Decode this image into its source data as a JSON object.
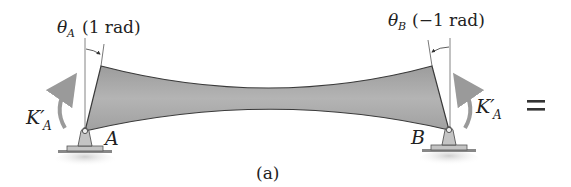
{
  "figure": {
    "caption": "(a)",
    "colors": {
      "beam_fill": "#a8a8a8",
      "beam_edge": "#3a3a3a",
      "support_fill": "#c4c4c4",
      "arrow": "#9a9a9a",
      "line": "#555555",
      "text": "#222222"
    },
    "labels": {
      "theta_a_symbol": "θ",
      "theta_a_sub": "A",
      "theta_a_value": "(1 rad)",
      "theta_b_symbol": "θ",
      "theta_b_sub": "B",
      "theta_b_value": "(−1 rad)",
      "moment_left_symbol": "K′",
      "moment_left_sub": "A",
      "moment_right_symbol": "K′",
      "moment_right_sub": "A",
      "support_left": "A",
      "support_right": "B",
      "equals": "="
    }
  }
}
